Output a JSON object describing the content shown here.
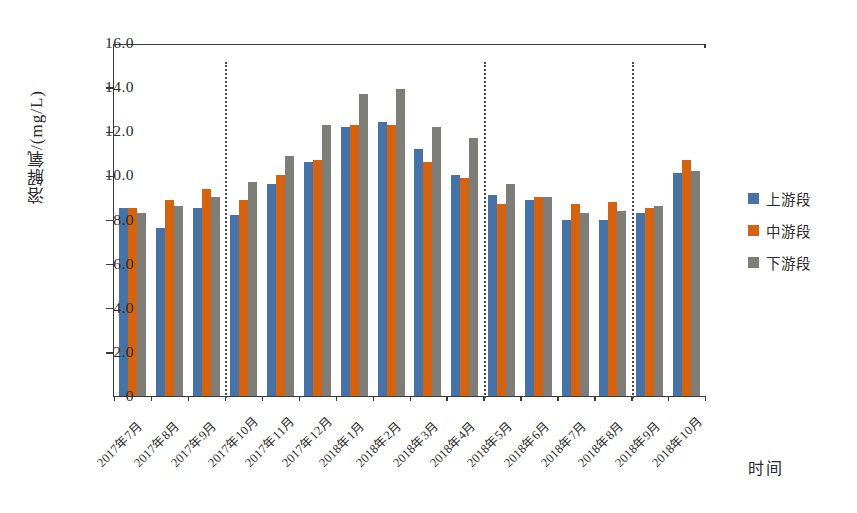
{
  "chart_data": {
    "type": "bar",
    "title": "",
    "xlabel": "时间",
    "ylabel": "溶解氧/(mg/L)",
    "ylim": [
      0,
      16.0
    ],
    "ytick_labels": [
      "16.0",
      "14.0",
      "12.0",
      "10.0",
      "8.0",
      "6.0",
      "4.0",
      "2.0",
      "0"
    ],
    "ytick_values": [
      16.0,
      14.0,
      12.0,
      10.0,
      8.0,
      6.0,
      4.0,
      2.0,
      0
    ],
    "grid": false,
    "legend_position": "right",
    "categories": [
      "2017年7月",
      "2017年8月",
      "2017年9月",
      "2017年10月",
      "2017年11月",
      "2017年12月",
      "2018年1月",
      "2018年2月",
      "2018年3月",
      "2018年4月",
      "2018年5月",
      "2018年6月",
      "2018年7月",
      "2018年8月",
      "2018年9月",
      "2018年10月"
    ],
    "series": [
      {
        "name": "上游段",
        "color": "#4672a8",
        "values": [
          8.5,
          7.6,
          8.5,
          8.2,
          9.6,
          10.6,
          12.2,
          12.4,
          11.2,
          10.0,
          9.1,
          8.9,
          8.0,
          8.0,
          8.3,
          10.1
        ]
      },
      {
        "name": "中游段",
        "color": "#d4620e",
        "values": [
          8.5,
          8.9,
          9.4,
          8.9,
          10.0,
          10.7,
          12.3,
          12.3,
          10.6,
          9.9,
          8.7,
          9.0,
          8.7,
          8.8,
          8.5,
          10.7
        ]
      },
      {
        "name": "下游段",
        "color": "#7e7d77",
        "values": [
          8.3,
          8.6,
          9.0,
          9.7,
          10.9,
          12.3,
          13.7,
          13.9,
          12.2,
          11.7,
          9.6,
          9.0,
          8.3,
          8.4,
          8.6,
          10.2
        ]
      }
    ],
    "dividers_after_category": [
      "2017年9月",
      "2018年4月",
      "2018年8月"
    ],
    "annotations": []
  },
  "legend": {
    "items": [
      {
        "label": "上游段",
        "color": "#4672a8"
      },
      {
        "label": "中游段",
        "color": "#d4620e"
      },
      {
        "label": "下游段",
        "color": "#7e7d77"
      }
    ]
  }
}
